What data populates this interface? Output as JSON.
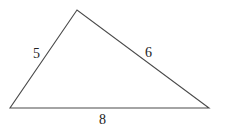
{
  "diagram": {
    "type": "triangle",
    "stroke_color": "#4a4a4a",
    "vertices": {
      "top": {
        "x": 77,
        "y": 10
      },
      "bottom_left": {
        "x": 10,
        "y": 108
      },
      "bottom_right": {
        "x": 209,
        "y": 108
      }
    },
    "sides": [
      {
        "name": "left",
        "label": "5",
        "x": 37,
        "y": 58
      },
      {
        "name": "right",
        "label": "6",
        "x": 149,
        "y": 57
      },
      {
        "name": "bottom",
        "label": "8",
        "x": 103,
        "y": 124
      }
    ]
  }
}
